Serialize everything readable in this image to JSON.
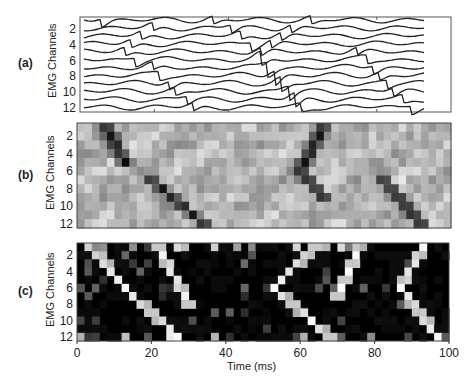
{
  "chart_data": [
    {
      "id": "a",
      "type": "line",
      "panel_label": "(a)",
      "title": "",
      "ylabel": "EMG Channels",
      "xlabel": "",
      "y_ticks": [
        "2",
        "4",
        "6",
        "8",
        "10",
        "12"
      ],
      "x_range": [
        0,
        100
      ],
      "y_range": [
        1,
        12
      ],
      "description": "12 stacked EMG channel traces over 0-100 ms; biphasic waves propagate diagonally across channels (around 20-30 ms downward, 45-60 ms, and 85-95 ms)",
      "series": [
        {
          "name": "ch1",
          "wave_centers_ms": [
            5,
            38,
            67
          ]
        },
        {
          "name": "ch2",
          "wave_centers_ms": [
            20,
            43,
            61
          ]
        },
        {
          "name": "ch3",
          "wave_centers_ms": [
            17,
            46,
            58
          ]
        },
        {
          "name": "ch4",
          "wave_centers_ms": [
            14,
            49,
            55
          ]
        },
        {
          "name": "ch5",
          "wave_centers_ms": [
            12,
            52,
            80
          ]
        },
        {
          "name": "ch6",
          "wave_centers_ms": [
            15,
            52,
            83
          ]
        },
        {
          "name": "ch7",
          "wave_centers_ms": [
            20,
            54,
            85
          ]
        },
        {
          "name": "ch8",
          "wave_centers_ms": [
            22,
            56,
            87
          ]
        },
        {
          "name": "ch9",
          "wave_centers_ms": [
            25,
            58,
            89
          ]
        },
        {
          "name": "ch10",
          "wave_centers_ms": [
            27,
            60,
            91
          ]
        },
        {
          "name": "ch11",
          "wave_centers_ms": [
            30,
            62,
            94
          ]
        },
        {
          "name": "ch12",
          "wave_centers_ms": [
            32,
            64,
            96
          ]
        }
      ]
    },
    {
      "id": "b",
      "type": "heatmap",
      "panel_label": "(b)",
      "ylabel": "EMG Channels",
      "xlabel": "",
      "y_ticks": [
        "2",
        "4",
        "6",
        "8",
        "10",
        "12"
      ],
      "x_range": [
        0,
        100
      ],
      "colormap": "gray",
      "description": "Grayscale heatmap of 12 channels vs time; dark diagonal bands descend from ch7 at ~20ms to ch12 at ~34ms, ascending band from ch6 ~60ms to ch1 ~66ms, descending from ch7 ~62ms to ch9 ~66ms, and from ch7 ~82ms to ch12 ~92ms"
    },
    {
      "id": "c",
      "type": "heatmap",
      "panel_label": "(c)",
      "ylabel": "EMG Channels",
      "xlabel": "Time (ms)",
      "x_ticks": [
        "0",
        "20",
        "40",
        "60",
        "80",
        "100"
      ],
      "y_ticks": [
        "2",
        "4",
        "6",
        "8",
        "10",
        "12"
      ],
      "x_range": [
        0,
        100
      ],
      "colormap": "gray (black background)",
      "description": "Sparse activation map on black; bright cells form chevron (V) patterns with vertices near ch6-7 at ~13ms, ~53ms, and ~87ms"
    }
  ],
  "labels": {
    "a": "(a)",
    "b": "(b)",
    "c": "(c)",
    "ylabel": "EMG Channels",
    "xlabel": "Time (ms)",
    "yticks": [
      "2",
      "4",
      "6",
      "8",
      "10",
      "12"
    ],
    "xticks": [
      "0",
      "20",
      "40",
      "60",
      "80",
      "100"
    ]
  }
}
